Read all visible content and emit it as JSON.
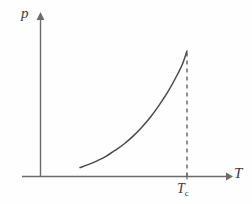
{
  "chart_data": {
    "type": "line",
    "title": "",
    "subtitle": "",
    "xlabel": "T",
    "ylabel": "p",
    "grid": false,
    "legend": null,
    "axis_style": "arrow-headed open axes",
    "xlim": [
      0,
      1.18
    ],
    "ylim": [
      0,
      1.1
    ],
    "series": [
      {
        "name": "vapour-pressure curve",
        "style": "solid",
        "color": "#4a4a4a",
        "x": [
          0.27,
          0.33,
          0.39,
          0.45,
          0.51,
          0.57,
          0.63,
          0.69,
          0.75,
          0.81,
          0.87,
          0.93,
          0.97,
          1.0
        ],
        "y": [
          0.07,
          0.095,
          0.125,
          0.16,
          0.205,
          0.255,
          0.315,
          0.385,
          0.465,
          0.56,
          0.665,
          0.79,
          0.885,
          0.985
        ]
      }
    ],
    "annotations": [
      {
        "name": "critical-point-dashed-line",
        "type": "vertical-dashed-line",
        "x": 1.0,
        "y_from": 0.0,
        "y_to": 0.985,
        "color": "#555555"
      }
    ],
    "ticks": {
      "x": [
        {
          "value": 1.0,
          "label": "T",
          "sublabel": "c"
        }
      ],
      "y": []
    }
  },
  "labels": {
    "y_axis": "p",
    "x_axis": "T",
    "critical_temperature": "T",
    "critical_temperature_sub": "c"
  },
  "colors": {
    "background": "#fefefe",
    "axis": "#6b6b6b",
    "curve": "#4a4a4a",
    "dashed": "#555555",
    "text": "#3b3b3b"
  }
}
